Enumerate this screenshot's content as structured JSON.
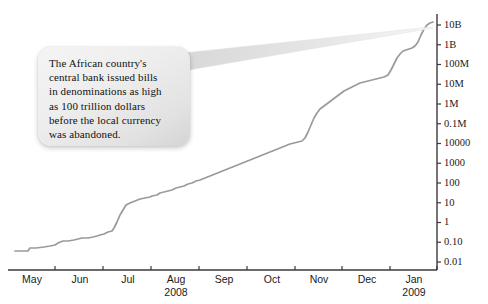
{
  "figure": {
    "background_color": "#ffffff",
    "line_color": "#9a9a9a",
    "axis_color": "#3a3a3a"
  },
  "annotation": {
    "name": "callout-bubble",
    "text": "The African country's\ncentral bank issued bills\nin denominations as high\nas 100 trillion dollars\nbefore the local currency\nwas abandoned.",
    "points_to": "end-of-curve-top-right",
    "fill_color": "#ececec"
  },
  "chart_data": {
    "type": "line",
    "title": "",
    "subtitle": "",
    "xlabel": "",
    "ylabel": "",
    "yscale": "log",
    "grid": false,
    "legend": null,
    "ytick_labels": [
      "10B",
      "1B",
      "100M",
      "10M",
      "1M",
      "0.1M",
      "10000",
      "1000",
      "100",
      "10",
      "1",
      "0.10",
      "0.01"
    ],
    "ytick_values": [
      10000000000,
      1000000000,
      100000000,
      10000000,
      1000000,
      100000,
      10000,
      1000,
      100,
      10,
      1,
      0.1,
      0.01
    ],
    "ylim": [
      0.01,
      10000000000
    ],
    "xtick_labels": [
      "May",
      "Jun",
      "Jul",
      "Aug",
      "Sep",
      "Oct",
      "Nov",
      "Dec",
      "Jan"
    ],
    "year_labels": [
      {
        "text": "2008",
        "under_tick": "Aug"
      },
      {
        "text": "2009",
        "under_tick": "Jan"
      }
    ],
    "x": [
      "May",
      "Jun",
      "Jul",
      "Aug",
      "Sep",
      "Oct",
      "Nov",
      "Dec",
      "Jan"
    ],
    "series": [
      {
        "name": "Zimbabwe price level / exchange rate",
        "points": [
          {
            "x": "May",
            "value": 0.05
          },
          {
            "x": "May+",
            "value": 0.07
          },
          {
            "x": "Jun",
            "value": 0.15
          },
          {
            "x": "Jun+",
            "value": 0.35
          },
          {
            "x": "Jul",
            "value": 1.3
          },
          {
            "x": "Jul+",
            "value": 8
          },
          {
            "x": "Aug",
            "value": 40
          },
          {
            "x": "Sep",
            "value": 500
          },
          {
            "x": "Sep+",
            "value": 2500
          },
          {
            "x": "Oct",
            "value": 9000
          },
          {
            "x": "Oct+",
            "value": 300000
          },
          {
            "x": "Nov",
            "value": 2000000
          },
          {
            "x": "Nov+",
            "value": 9000000
          },
          {
            "x": "Dec",
            "value": 30000000
          },
          {
            "x": "Dec+",
            "value": 90000000
          },
          {
            "x": "Jan",
            "value": 9000000000
          }
        ]
      }
    ]
  }
}
